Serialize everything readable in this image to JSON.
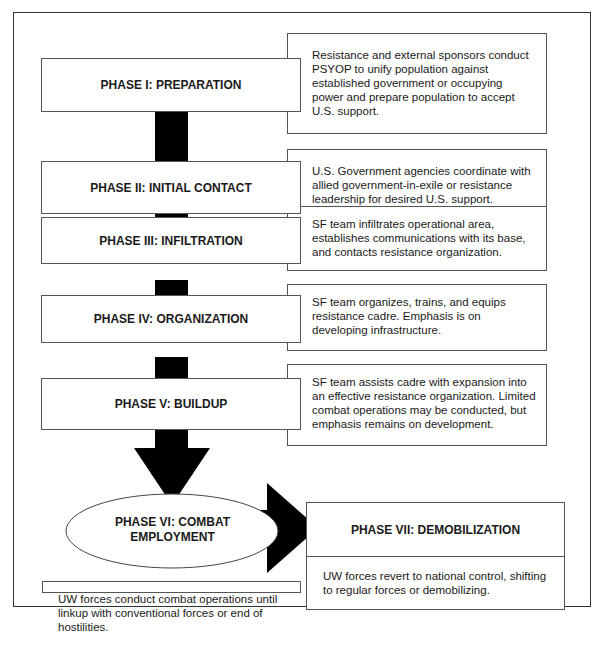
{
  "diagram": {
    "phases": [
      {
        "label": "PHASE I: PREPARATION",
        "description": "Resistance and external sponsors conduct PSYOP to unify population against established government or occupying power and prepare population to accept U.S. support."
      },
      {
        "label": "PHASE II: INITIAL CONTACT",
        "description": "U.S. Government agencies coordinate with allied government-in-exile or resistance leadership for desired U.S. support."
      },
      {
        "label": "PHASE III: INFILTRATION",
        "description": "SF team infiltrates operational area, establishes communications with its base, and contacts resistance organization."
      },
      {
        "label": "PHASE IV: ORGANIZATION",
        "description": "SF team organizes, trains, and equips resistance cadre. Emphasis is on developing infrastructure."
      },
      {
        "label": "PHASE V: BUILDUP",
        "description": "SF team assists cadre with expansion into an effective resistance organization. Limited combat operations may be conducted, but emphasis remains on development."
      },
      {
        "label": "PHASE VI: COMBAT EMPLOYMENT",
        "description": "UW forces conduct combat operations until linkup with conventional forces or end of hostilities."
      },
      {
        "label": "PHASE VII: DEMOBILIZATION",
        "description": "UW forces revert to national control, shifting to regular forces or demobilizing."
      }
    ]
  }
}
